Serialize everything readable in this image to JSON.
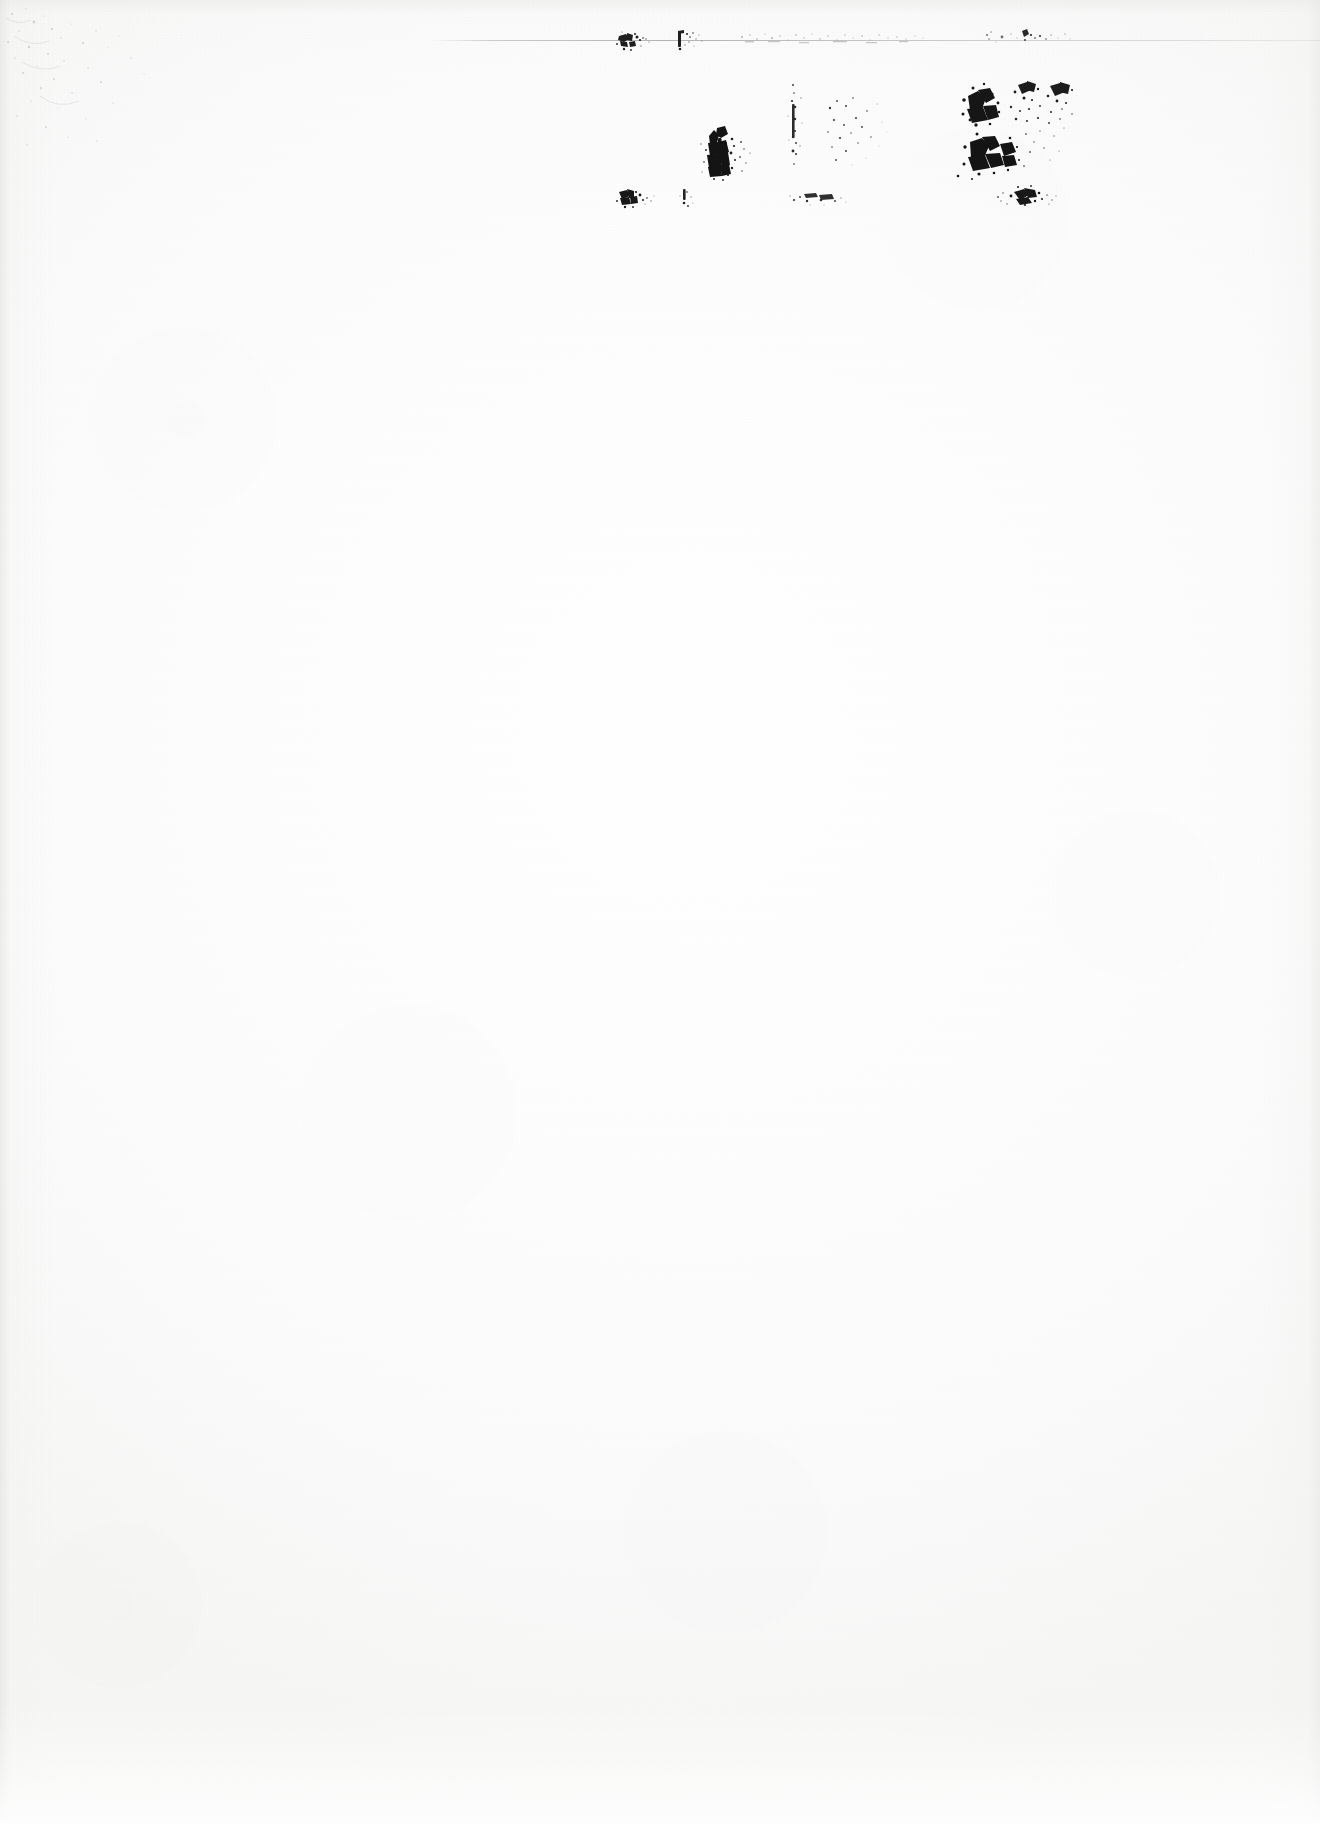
{
  "document": {
    "kind": "scanned-page",
    "condition": "severely-degraded",
    "legibility": "illegible",
    "page_width": 1320,
    "page_height": 1824,
    "background_color": "#fefefe",
    "paper_tone": "#fafaf9",
    "ink_color": "#1a1a1a",
    "orientation": "portrait",
    "content_region": "upper-right quadrant",
    "blank_area_note": "remainder of page is blank"
  },
  "header_rule": {
    "name": "horizontal-rule",
    "x": 430,
    "y": 40,
    "width": 890,
    "color": "#8a8a8a",
    "opacity": 0.55
  },
  "text_block": {
    "x": 612,
    "y": 26,
    "width": 462,
    "height": 182,
    "row_count": 3,
    "column_count": 4,
    "rows": [
      {
        "name": "row-1",
        "y": 34,
        "height": 22,
        "fragments": [
          {
            "name": "fragment-r1c1",
            "x": 620,
            "y": 34,
            "width": 30,
            "height": 16,
            "density": 0.78,
            "legible": false,
            "text": ""
          },
          {
            "name": "fragment-r1c2",
            "x": 678,
            "y": 32,
            "width": 26,
            "height": 18,
            "density": 0.55,
            "legible": false,
            "text": ""
          },
          {
            "name": "fragment-r1c3",
            "x": 742,
            "y": 32,
            "width": 182,
            "height": 15,
            "density": 0.14,
            "legible": false,
            "text": ""
          },
          {
            "name": "fragment-r1c4",
            "x": 982,
            "y": 30,
            "width": 88,
            "height": 18,
            "density": 0.2,
            "legible": false,
            "text": ""
          }
        ]
      },
      {
        "name": "row-2",
        "y": 86,
        "height": 92,
        "fragments": [
          {
            "name": "fragment-r2c1",
            "x": 702,
            "y": 126,
            "width": 44,
            "height": 52,
            "density": 0.92,
            "legible": false,
            "text": ""
          },
          {
            "name": "fragment-r2c2",
            "x": 790,
            "y": 84,
            "width": 22,
            "height": 84,
            "density": 0.38,
            "legible": false,
            "text": ""
          },
          {
            "name": "fragment-r2c3",
            "x": 826,
            "y": 96,
            "width": 64,
            "height": 72,
            "density": 0.22,
            "legible": false,
            "text": ""
          },
          {
            "name": "fragment-r2c4",
            "x": 958,
            "y": 80,
            "width": 116,
            "height": 96,
            "density": 0.88,
            "legible": false,
            "text": ""
          }
        ]
      },
      {
        "name": "row-3",
        "y": 190,
        "height": 20,
        "fragments": [
          {
            "name": "fragment-r3c1",
            "x": 620,
            "y": 190,
            "width": 32,
            "height": 16,
            "density": 0.8,
            "legible": false,
            "text": ""
          },
          {
            "name": "fragment-r3c2",
            "x": 682,
            "y": 190,
            "width": 12,
            "height": 16,
            "density": 0.42,
            "legible": false,
            "text": ""
          },
          {
            "name": "fragment-r3c3",
            "x": 792,
            "y": 192,
            "width": 56,
            "height": 14,
            "density": 0.48,
            "legible": false,
            "text": ""
          },
          {
            "name": "fragment-r3c4",
            "x": 996,
            "y": 188,
            "width": 58,
            "height": 18,
            "density": 0.72,
            "legible": false,
            "text": ""
          }
        ]
      }
    ]
  },
  "artifacts": {
    "corner_speckle": {
      "name": "scan-speckle-top-left",
      "x": 0,
      "y": 0,
      "width": 210,
      "height": 160
    },
    "bottom_edge": {
      "name": "scan-edge-bottom",
      "description": "ragged bleached band"
    }
  },
  "accessibility": {
    "summary": "Scanned page, almost entirely blank. A small block of heavily degraded, unreadable typed text sits in the upper right, beneath a faint horizontal rule."
  }
}
